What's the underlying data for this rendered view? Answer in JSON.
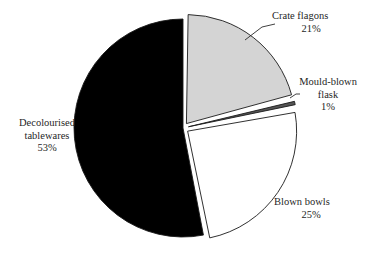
{
  "chart_data": {
    "type": "pie",
    "title": "",
    "subtitle": "",
    "xlabel": "",
    "ylabel": "",
    "legend_position": "none",
    "grid": false,
    "value_unit": "%",
    "slices": [
      {
        "label": "Crate flagons",
        "value": 21,
        "value_label": "21%",
        "color": "#d4d4d4",
        "exploded": true
      },
      {
        "label": "Mould-blown flask",
        "label_line1": "Mould-blown",
        "label_line2": "flask",
        "value": 1,
        "value_label": "1%",
        "color": "#555555",
        "exploded": true
      },
      {
        "label": "Blown bowls",
        "value": 25,
        "value_label": "25%",
        "color": "#ffffff",
        "exploded": true
      },
      {
        "label": "Decolourised tablewares",
        "label_line1": "Decolourised",
        "label_line2": "tablewares",
        "value": 53,
        "value_label": "53%",
        "color": "#000000",
        "exploded": false
      }
    ],
    "categories": [
      "Crate flagons",
      "Mould-blown flask",
      "Blown bowls",
      "Decolourised tablewares"
    ],
    "values": [
      21,
      1,
      25,
      53
    ],
    "colors": [
      "#d4d4d4",
      "#555555",
      "#ffffff",
      "#000000"
    ],
    "outline_color": "#1a1a1a",
    "background": "#ffffff"
  }
}
